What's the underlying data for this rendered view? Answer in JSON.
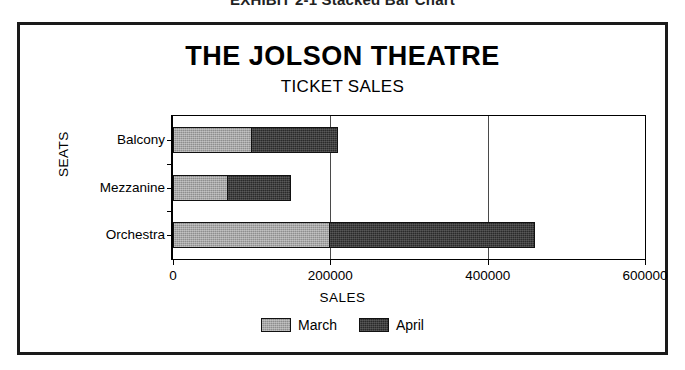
{
  "exhibit": {
    "caption": "EXHIBIT 2-1  Stacked Bar Chart"
  },
  "chart_data": {
    "type": "bar",
    "orientation": "horizontal",
    "stacked": true,
    "title": "THE JOLSON THEATRE",
    "subtitle": "TICKET SALES",
    "xlabel": "SALES",
    "ylabel": "SEATS",
    "categories": [
      "Balcony",
      "Mezzanine",
      "Orchestra"
    ],
    "series": [
      {
        "name": "March",
        "color": "#8e8e8e",
        "values": [
          100000,
          70000,
          200000
        ]
      },
      {
        "name": "April",
        "color": "#2a2a2a",
        "values": [
          110000,
          80000,
          260000
        ]
      }
    ],
    "totals": [
      210000,
      150000,
      460000
    ],
    "xlim": [
      0,
      600000
    ],
    "xticks": [
      0,
      200000,
      400000,
      600000
    ],
    "xtick_labels": [
      "0",
      "200000",
      "400000",
      "600000"
    ],
    "gridlines": [
      200000,
      400000
    ],
    "grid": true,
    "legend_position": "bottom"
  }
}
